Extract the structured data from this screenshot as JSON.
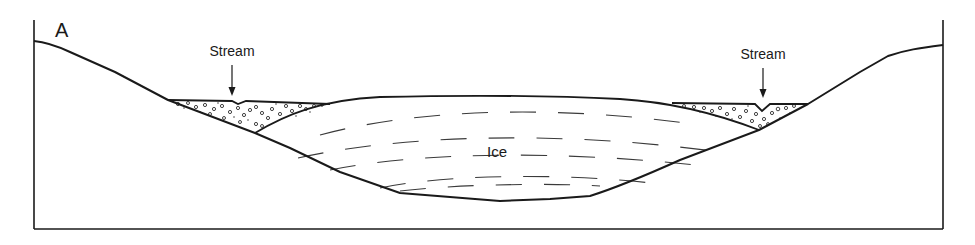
{
  "figure": {
    "panel_label": "A",
    "labels": {
      "left_stream": "Stream",
      "right_stream": "Stream",
      "ice": "Ice"
    },
    "colors": {
      "line": "#1a1a1a",
      "dash": "#3a3a3a",
      "background": "#ffffff",
      "gravel": "#444444"
    }
  }
}
